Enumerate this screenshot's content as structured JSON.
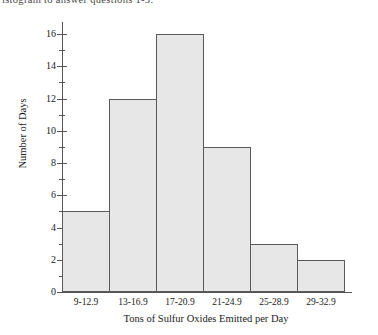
{
  "caption": {
    "text": "istogram to answer questions 1-3."
  },
  "chart_data": {
    "type": "bar",
    "title": "",
    "subtitle": "",
    "xlabel": "Tons of Sulfur Oxides Emitted per Day",
    "ylabel": "Number of Days",
    "categories": [
      "9-12.9",
      "13-16.9",
      "17-20.9",
      "21-24.9",
      "25-28.9",
      "29-32.9"
    ],
    "values": [
      5,
      12,
      16,
      9,
      3,
      2
    ],
    "ylim": [
      0,
      16
    ],
    "ytick_major": [
      0,
      2,
      4,
      6,
      8,
      10,
      12,
      14,
      16
    ],
    "ytick_minor": [
      1,
      3,
      5,
      7,
      9,
      11,
      13,
      15
    ],
    "ytick_labels": [
      "0",
      "2",
      "4",
      "6",
      "8",
      "10",
      "12",
      "14",
      "16"
    ],
    "grid": false,
    "legend": false,
    "bar_fill_color": "#e7e7e7",
    "bar_edge_color": "#5a5a5a",
    "axis_color": "#555555",
    "background_color": "#ffffff"
  }
}
